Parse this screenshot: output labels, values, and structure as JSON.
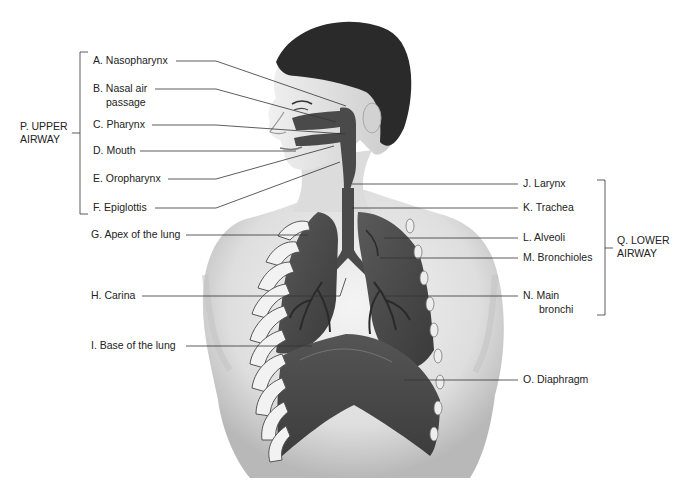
{
  "diagram": {
    "type": "anatomical-labeled-illustration",
    "groups": [
      {
        "id": "P",
        "label_line1": "P. UPPER",
        "label_line2": "AIRWAY",
        "members": [
          "A",
          "B",
          "C",
          "D",
          "E",
          "F"
        ]
      },
      {
        "id": "Q",
        "label_line1": "Q. LOWER",
        "label_line2": "AIRWAY",
        "members": [
          "J",
          "K",
          "L",
          "M",
          "N"
        ]
      }
    ],
    "labels": {
      "a": "A. Nasopharynx",
      "b1": "B. Nasal air",
      "b2": "passage",
      "c": "C. Pharynx",
      "d": "D. Mouth",
      "e": "E. Oropharynx",
      "f": "F. Epiglottis",
      "g": "G. Apex of the lung",
      "h": "H. Carina",
      "i": "I.  Base of the lung",
      "j": "J. Larynx",
      "k": "K. Trachea",
      "l": "L. Alveoli",
      "m": "M. Bronchioles",
      "n1": "N. Main",
      "n2": "bronchi",
      "o": "O. Diaphragm"
    },
    "colors": {
      "label_text": "#222222",
      "leader_line": "#333333",
      "skin": "#e6e6e6",
      "skin_shadow": "#bdbdbd",
      "hair": "#2a2a2a",
      "airway": "#4a4a4a",
      "lung": "#4d4d4d",
      "rib": "#f2f2f2"
    }
  }
}
